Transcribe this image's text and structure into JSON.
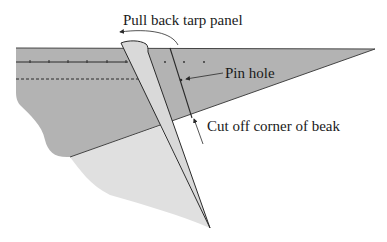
{
  "diagram": {
    "labels": {
      "pull_back": "Pull back tarp panel",
      "pin_hole": "Pin hole",
      "cut_off": "Cut off corner of beak"
    },
    "colors": {
      "tarp_main": "#b3b3b3",
      "tarp_lower": "#e0e0e0",
      "panel_folded": "#d9d9d9",
      "lines": "#2a2a2a",
      "background": "#ffffff"
    },
    "elements": [
      "main-tarp-band",
      "lower-tarp-region",
      "folded-tarp-panel",
      "solid-seam-line-with-pin-marks",
      "dashed-seam-line",
      "crease-line",
      "pin-hole-leader-arrow",
      "cut-off-leader-arrow",
      "pull-back-curved-arrow"
    ]
  }
}
